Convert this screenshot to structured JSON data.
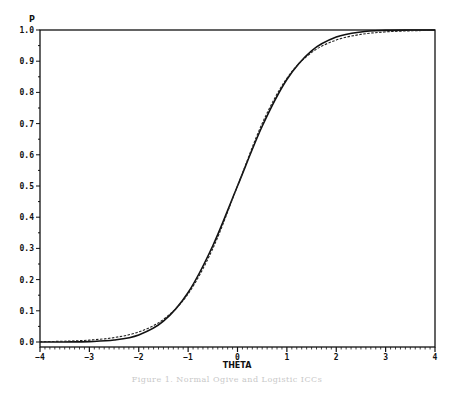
{
  "chart_data": {
    "type": "line",
    "title": "",
    "xlabel": "THETA",
    "ylabel": "P",
    "xlim": [
      -4,
      4
    ],
    "ylim": [
      0.0,
      1.0
    ],
    "grid": false,
    "legend": null,
    "x_ticks": [
      "-4",
      "-3",
      "-2",
      "-1",
      "0",
      "1",
      "2",
      "3",
      "4"
    ],
    "y_ticks": [
      "0.0",
      "0.1",
      "0.2",
      "0.3",
      "0.4",
      "0.5",
      "0.6",
      "0.7",
      "0.8",
      "0.9",
      "1.0"
    ],
    "x_minor_ticks_per_unit": 10,
    "y_minor_ticks_per_unit": 2,
    "x": [
      -4,
      -3.5,
      -3,
      -2.5,
      -2,
      -1.5,
      -1,
      -0.5,
      0,
      0.5,
      1,
      1.5,
      2,
      2.5,
      3,
      3.5,
      4
    ],
    "series": [
      {
        "name": "normal ogive (solid)",
        "style": "solid",
        "values": [
          0.0,
          0.0002,
          0.0013,
          0.0062,
          0.0228,
          0.0668,
          0.1587,
          0.3085,
          0.5,
          0.6915,
          0.8413,
          0.9332,
          0.9772,
          0.9938,
          0.9987,
          0.9998,
          1.0
        ]
      },
      {
        "name": "logistic D=1.7 (dashed)",
        "style": "dashed",
        "values": [
          0.0011,
          0.0026,
          0.0061,
          0.0141,
          0.0323,
          0.0724,
          0.1545,
          0.2994,
          0.5,
          0.7006,
          0.8455,
          0.9276,
          0.9677,
          0.9859,
          0.9939,
          0.9974,
          0.9989
        ]
      }
    ]
  },
  "caption": "Figure 1.  Normal Ogive and Logistic ICCs"
}
